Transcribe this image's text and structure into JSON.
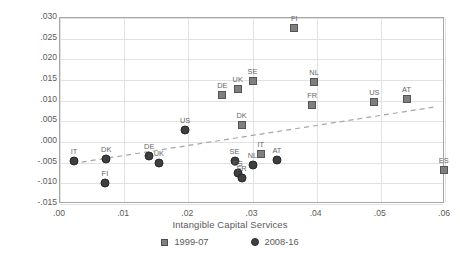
{
  "chart_data": {
    "type": "scatter",
    "title": "",
    "xlabel": "Intangible Capital Services",
    "ylabel": "Total Factor Productivity",
    "xlim": [
      0.0,
      0.06
    ],
    "ylim": [
      -0.015,
      0.03
    ],
    "xticks": [
      ".00",
      ".01",
      ".02",
      ".03",
      ".04",
      ".05",
      ".06"
    ],
    "xtick_values": [
      0.0,
      0.01,
      0.02,
      0.03,
      0.04,
      0.05,
      0.06
    ],
    "yticks": [
      ".030",
      ".025",
      ".020",
      ".015",
      ".010",
      ".005",
      ".000",
      "-.005",
      "-.010",
      "-.015"
    ],
    "ytick_values": [
      0.03,
      0.025,
      0.02,
      0.015,
      0.01,
      0.005,
      0.0,
      -0.005,
      -0.01,
      -0.015
    ],
    "grid": true,
    "legend_position": "bottom",
    "legend": [
      {
        "label": "1999-07",
        "marker": "square",
        "color": "#7f7f7f"
      },
      {
        "label": "2008-16",
        "marker": "circle",
        "color": "#3f3f3f"
      }
    ],
    "series": [
      {
        "name": "1999-07",
        "marker": "square",
        "points": [
          {
            "label": "FI",
            "x": 0.0365,
            "y": 0.0275
          },
          {
            "label": "SE",
            "x": 0.03,
            "y": 0.0148
          },
          {
            "label": "NL",
            "x": 0.0396,
            "y": 0.0145
          },
          {
            "label": "UK",
            "x": 0.0277,
            "y": 0.0128
          },
          {
            "label": "DE",
            "x": 0.0253,
            "y": 0.0113
          },
          {
            "label": "US",
            "x": 0.049,
            "y": 0.0097
          },
          {
            "label": "AT",
            "x": 0.054,
            "y": 0.0103
          },
          {
            "label": "FR",
            "x": 0.0393,
            "y": 0.009
          },
          {
            "label": "DK",
            "x": 0.0283,
            "y": 0.004
          },
          {
            "label": "IT",
            "x": 0.0313,
            "y": -0.003
          },
          {
            "label": "ES",
            "x": 0.0598,
            "y": -0.0068
          }
        ]
      },
      {
        "name": "2008-16",
        "marker": "circle",
        "points": [
          {
            "label": "US",
            "x": 0.0195,
            "y": 0.003
          },
          {
            "label": "IT",
            "x": 0.0022,
            "y": -0.0045
          },
          {
            "label": "DK",
            "x": 0.0072,
            "y": -0.0042
          },
          {
            "label": "DE",
            "x": 0.0139,
            "y": -0.0035
          },
          {
            "label": "UK",
            "x": 0.0154,
            "y": -0.005
          },
          {
            "label": "SE",
            "x": 0.0272,
            "y": -0.0045
          },
          {
            "label": "ES",
            "x": 0.0277,
            "y": -0.0075
          },
          {
            "label": "FR",
            "x": 0.0283,
            "y": -0.0088
          },
          {
            "label": "NL",
            "x": 0.03,
            "y": -0.0055
          },
          {
            "label": "AT",
            "x": 0.0338,
            "y": -0.0043
          },
          {
            "label": "FI",
            "x": 0.007,
            "y": -0.0098
          }
        ]
      }
    ],
    "trendline": {
      "style": "dashed",
      "color": "#a6a6a6",
      "x_start": 0.002,
      "y_start": -0.0052,
      "x_end": 0.0585,
      "y_end": 0.0085
    }
  }
}
